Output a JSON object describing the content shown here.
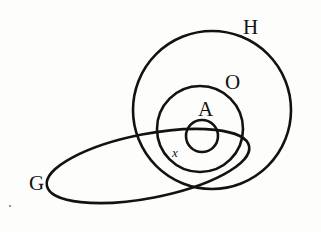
{
  "diagram": {
    "type": "euler-set-diagram",
    "canvas": {
      "width": 321,
      "height": 232
    },
    "background_color": "#fdfdfb",
    "stroke_color": "#121210",
    "shapes": [
      {
        "id": "H",
        "name": "circle-h",
        "kind": "circle",
        "cx": 212,
        "cy": 110,
        "r": 79,
        "stroke_width": 2.6
      },
      {
        "id": "O",
        "name": "circle-o",
        "kind": "circle",
        "cx": 200,
        "cy": 129,
        "r": 43,
        "stroke_width": 2.6
      },
      {
        "id": "A",
        "name": "circle-a",
        "kind": "circle",
        "cx": 202,
        "cy": 136,
        "r": 16,
        "stroke_width": 2.6
      },
      {
        "id": "G",
        "name": "ellipse-g",
        "kind": "ellipse",
        "cx": 148,
        "cy": 166,
        "rx": 103,
        "ry": 32,
        "rotation_deg": -11,
        "stroke_width": 2.6
      }
    ],
    "labels": [
      {
        "id": "H",
        "text": "H",
        "x": 243,
        "y": 17,
        "size": "cap"
      },
      {
        "id": "O",
        "text": "O",
        "x": 225,
        "y": 72,
        "size": "cap"
      },
      {
        "id": "A",
        "text": "A",
        "x": 198,
        "y": 99,
        "size": "cap"
      },
      {
        "id": "x",
        "text": "x",
        "x": 172,
        "y": 146,
        "size": "small"
      },
      {
        "id": "G",
        "text": "G",
        "x": 29,
        "y": 173,
        "size": "cap"
      }
    ],
    "specks": [
      {
        "x": 9,
        "y": 205
      }
    ]
  },
  "chart_data": {
    "type": "diagram",
    "subtype": "euler-venn",
    "title": "",
    "sets": [
      {
        "label": "H",
        "role": "outermost-universe-circle",
        "contains": [
          "O",
          "A"
        ]
      },
      {
        "label": "O",
        "role": "middle-circle",
        "contains": [
          "A"
        ],
        "inside": [
          "H"
        ]
      },
      {
        "label": "A",
        "role": "innermost-circle",
        "inside": [
          "O",
          "H"
        ]
      },
      {
        "label": "G",
        "role": "tilted-ellipse",
        "overlaps": [
          "H",
          "O",
          "A"
        ]
      }
    ],
    "points": [
      {
        "label": "x",
        "member_of": [
          "G",
          "O",
          "H"
        ],
        "near": "A"
      }
    ],
    "legend": [],
    "annotations": [
      "H",
      "O",
      "A",
      "x",
      "G"
    ]
  }
}
